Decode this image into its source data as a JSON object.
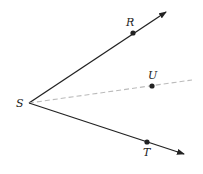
{
  "diagram": {
    "points": {
      "S": {
        "label": "S",
        "x": 29,
        "y": 103
      },
      "R": {
        "label": "R",
        "x": 133,
        "y": 33
      },
      "U": {
        "label": "U",
        "x": 152,
        "y": 86
      },
      "T": {
        "label": "T",
        "x": 147,
        "y": 142
      }
    },
    "rays": [
      {
        "name": "SR",
        "style": "solid",
        "color": "#222222"
      },
      {
        "name": "SU",
        "style": "dashed",
        "color": "#bbbbbb"
      },
      {
        "name": "ST",
        "style": "solid",
        "color": "#222222"
      }
    ]
  }
}
